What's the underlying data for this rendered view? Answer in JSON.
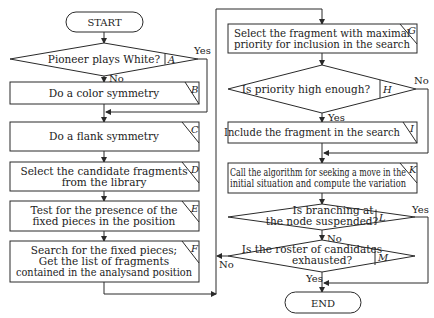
{
  "terminals": {
    "start": "START",
    "end": "END"
  },
  "nodes": {
    "A": {
      "letter": "A",
      "lines": [
        "Pioneer plays White?"
      ]
    },
    "B": {
      "letter": "B",
      "lines": [
        "Do a color symmetry"
      ]
    },
    "C": {
      "letter": "C",
      "lines": [
        "Do a flank symmetry"
      ]
    },
    "D": {
      "letter": "D",
      "lines": [
        "Select the candidate fragments",
        "from the library"
      ]
    },
    "E": {
      "letter": "E",
      "lines": [
        "Test for the presence of the",
        "fixed pieces in the position"
      ]
    },
    "F": {
      "letter": "F",
      "lines": [
        "Search for the fixed pieces;",
        "Get the list of fragments",
        "contained in the analysand position"
      ]
    },
    "G": {
      "letter": "G",
      "lines": [
        "Select the fragment with maximal",
        "priority for inclusion in the search"
      ]
    },
    "H": {
      "letter": "H",
      "lines": [
        "Is priority high enough?"
      ]
    },
    "I": {
      "letter": "I",
      "lines": [
        "Include the fragment in the search"
      ]
    },
    "K": {
      "letter": "K",
      "lines": [
        "Call the algorithm for seeking a move in the",
        "initial situation and compute the variation"
      ]
    },
    "L": {
      "letter": "L",
      "lines": [
        "Is branching at",
        "the node suspended?"
      ]
    },
    "M": {
      "letter": "M",
      "lines": [
        "Is the roster of candidates",
        "exhausted?"
      ]
    }
  },
  "edge_labels": {
    "A_yes": "Yes",
    "A_no": "No",
    "H_yes": "Yes",
    "H_no": "No",
    "L_yes": "Yes",
    "L_no": "No",
    "M_yes": "Yes",
    "M_no": "No"
  }
}
